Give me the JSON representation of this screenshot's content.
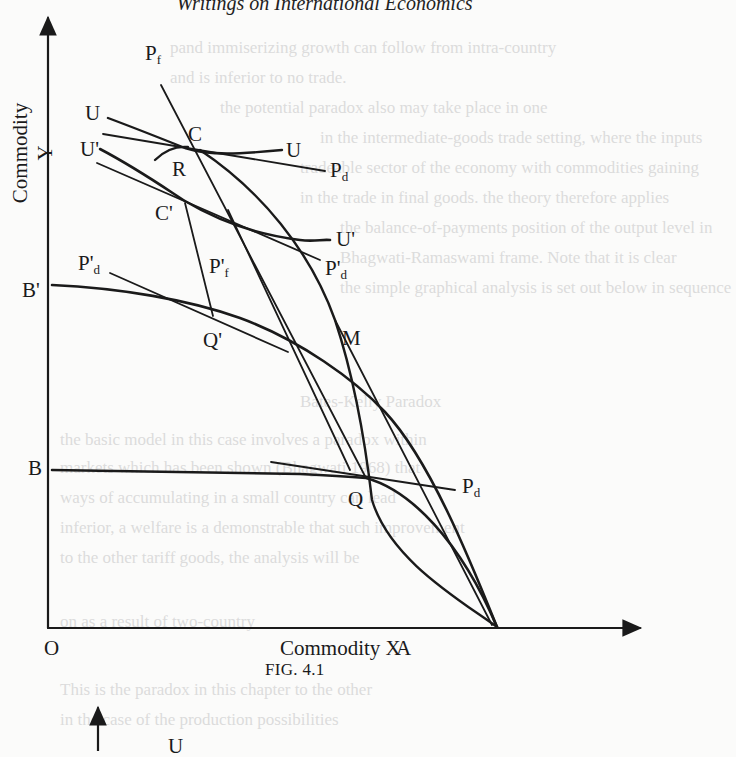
{
  "page": {
    "running_head": "Writings on International Economics",
    "bleed_through_lines": [
      "pand immiserizing growth can follow from intra-country",
      "and is inferior to no trade.",
      "the potential paradox also may take place in one",
      "in the intermediate-goods trade setting, where the inputs",
      "tradeable sector of the economy with commodities gaining",
      "in the trade in final goods. the theory therefore applies",
      "the balance-of-payments position of the output level in",
      "Bhagwati-Ramaswami frame. Note that it is clear",
      "the simple graphical analysis is set out below in sequence",
      "Bates-Kelly Paradox",
      "the basic model in this case involves a paradox within",
      "markets which has been shown (Bhagwati 1968) that",
      "ways of accumulating in a small country can lead",
      "inferior, a welfare is a demonstrable that such improvement",
      "to the other tariff goods, the analysis will be",
      "on as a result of two-country",
      "This is the paradox in this chapter to the other",
      "in the case of the production possibilities",
      "Intermediate"
    ]
  },
  "figure": {
    "caption": "FIG. 4.1",
    "x_axis_label": "Commodity X",
    "y_axis_label": "Commodity Y",
    "origin_label": "O",
    "points": {
      "A": "A",
      "B": "B",
      "B_prime": "B'",
      "C": "C",
      "C_prime": "C'",
      "R": "R",
      "Q": "Q",
      "Q_prime": "Q'",
      "M": "M"
    },
    "curve_labels": {
      "U_left": "U",
      "U_right": "U",
      "U_prime_left": "U'",
      "U_prime_right": "U'",
      "Pf": {
        "base": "P",
        "sub": "f"
      },
      "Pd_top": {
        "base": "P",
        "sub": "d"
      },
      "Pd_prime_right": {
        "base": "P'",
        "sub": "d"
      },
      "Pd_prime_left": {
        "base": "P'",
        "sub": "d"
      },
      "Pf_prime": {
        "base": "P'",
        "sub": "f"
      },
      "Pd_bottom": {
        "base": "P",
        "sub": "d"
      }
    },
    "second_figure_fragment": {
      "label": "U"
    }
  }
}
